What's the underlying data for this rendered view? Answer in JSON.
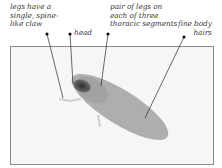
{
  "diagram": {
    "labels": [
      {
        "id": "claw",
        "text": "legs have a\nsingle, spine-\nlike claw"
      },
      {
        "id": "head",
        "text": "head"
      },
      {
        "id": "legs",
        "text": "pair of legs on\neach of three\nthoracic segments"
      },
      {
        "id": "hairs",
        "text": "fine body\nhairs"
      }
    ],
    "colors": {
      "text": "#3a3a3a",
      "leader": "#2a2a2a",
      "frame": "#8c8c8c",
      "background": "#f6f6f6",
      "body": "#9a9a9a",
      "head": "#3c3c3c"
    }
  }
}
